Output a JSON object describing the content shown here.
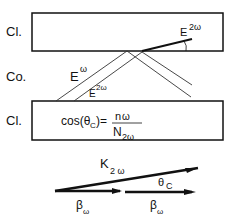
{
  "layers": {
    "top_label": "Cl.",
    "middle_label": "Co.",
    "bottom_label": "Cl."
  },
  "fields": {
    "e_omega_base": "E",
    "e_omega_sup": "ω",
    "e2w_guided_base": "E",
    "e2w_guided_sup": "2ω",
    "e2w_radiated_base": "E",
    "e2w_radiated_sup": "2ω"
  },
  "equation": {
    "lhs": "cos(θ",
    "lhs_sub": "C",
    "lhs_close": ")=",
    "numerator": "n",
    "numerator_sub": "ω",
    "denominator": "N",
    "denominator_sub": "2ω"
  },
  "vectors": {
    "k_base": "K",
    "k_sub": "2 ω",
    "theta_base": "θ",
    "theta_sub": "C",
    "beta1_base": "β",
    "beta1_sub": "ω",
    "beta2_base": "β",
    "beta2_sub": "ω"
  }
}
